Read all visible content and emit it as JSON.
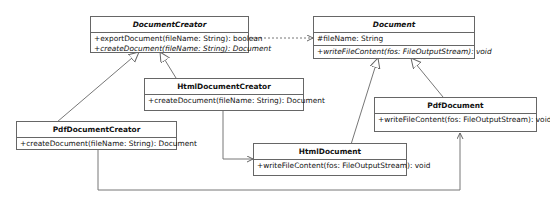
{
  "diagram": {
    "type": "UML class diagram",
    "classes": [
      {
        "id": "DocumentCreator",
        "name": "DocumentCreator",
        "abstract": true,
        "attributes": [],
        "methods": [
          {
            "text": "+exportDocument(fileName: String): boolean",
            "abstract": false
          },
          {
            "text": "+createDocument(fileName: String): Document",
            "abstract": true
          }
        ]
      },
      {
        "id": "Document",
        "name": "Document",
        "abstract": true,
        "attributes": [
          {
            "text": "#fileName: String"
          }
        ],
        "methods": [
          {
            "text": "+writeFileContent(fos: FileOutputStream): void",
            "abstract": true
          }
        ]
      },
      {
        "id": "HtmlDocumentCreator",
        "name": "HtmlDocumentCreator",
        "abstract": false,
        "attributes": [],
        "methods": [
          {
            "text": "+createDocument(fileName: String): Document",
            "abstract": false
          }
        ]
      },
      {
        "id": "PdfDocumentCreator",
        "name": "PdfDocumentCreator",
        "abstract": false,
        "attributes": [],
        "methods": [
          {
            "text": "+createDocument(fileName: String): Document",
            "abstract": false
          }
        ]
      },
      {
        "id": "PdfDocument",
        "name": "PdfDocument",
        "abstract": false,
        "attributes": [],
        "methods": [
          {
            "text": "+writeFileContent(fos: FileOutputStream): void",
            "abstract": false
          }
        ]
      },
      {
        "id": "HtmlDocument",
        "name": "HtmlDocument",
        "abstract": false,
        "attributes": [],
        "methods": [
          {
            "text": "+writeFileContent(fos: FileOutputStream): void",
            "abstract": false
          }
        ]
      }
    ],
    "relationships": [
      {
        "from": "HtmlDocumentCreator",
        "to": "DocumentCreator",
        "kind": "generalization"
      },
      {
        "from": "PdfDocumentCreator",
        "to": "DocumentCreator",
        "kind": "generalization"
      },
      {
        "from": "HtmlDocument",
        "to": "Document",
        "kind": "generalization"
      },
      {
        "from": "PdfDocument",
        "to": "Document",
        "kind": "generalization"
      },
      {
        "from": "DocumentCreator",
        "to": "Document",
        "kind": "dependency"
      },
      {
        "from": "HtmlDocumentCreator",
        "to": "HtmlDocument",
        "kind": "association"
      },
      {
        "from": "PdfDocumentCreator",
        "to": "PdfDocument",
        "kind": "association"
      }
    ]
  }
}
